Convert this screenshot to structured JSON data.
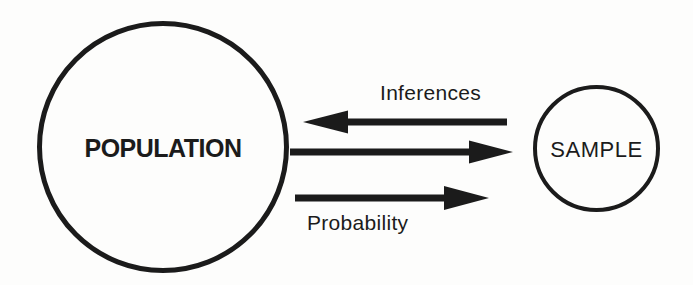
{
  "diagram": {
    "nodes": {
      "population": {
        "label": "POPULATION",
        "shape": "circle"
      },
      "sample": {
        "label": "SAMPLE",
        "shape": "circle"
      }
    },
    "arrows": [
      {
        "name": "inferences-arrow",
        "label": "Inferences",
        "direction": "left",
        "from": "SAMPLE",
        "to": "POPULATION"
      },
      {
        "name": "sampling-arrow",
        "label": "",
        "direction": "right",
        "from": "POPULATION",
        "to": "SAMPLE"
      },
      {
        "name": "probability-arrow",
        "label": "Probability",
        "direction": "right",
        "from": "POPULATION",
        "to": "SAMPLE"
      }
    ]
  },
  "colors": {
    "ink": "#1b1b1b",
    "paper": "#fdfdfc"
  }
}
